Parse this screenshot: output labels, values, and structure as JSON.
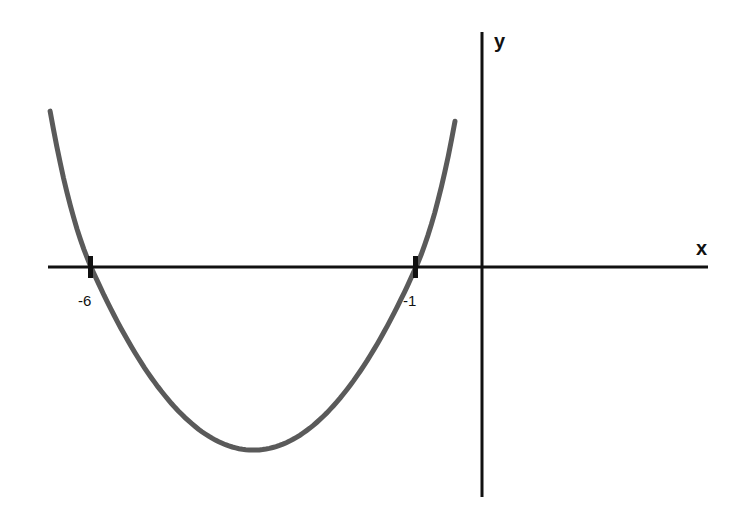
{
  "chart_data": {
    "type": "line",
    "title": "",
    "function": "y = (x + 6)(x + 1)",
    "xlabel": "x",
    "ylabel": "y",
    "x_intercepts": [
      -6,
      -1
    ],
    "tick_labels": [
      "-6",
      "-1"
    ],
    "vertex": {
      "x": -3.5,
      "y": -6.25
    },
    "xlim": [
      -6.65,
      3.5
    ],
    "grid": false,
    "legend": false,
    "series": [
      {
        "name": "parabola",
        "color": "#555555",
        "x": [
          -6.6,
          -6,
          -5,
          -4,
          -3.5,
          -3,
          -2,
          -1,
          -0.4
        ],
        "y": [
          3.96,
          0,
          -4,
          -6,
          -6.25,
          -6,
          -4,
          0,
          3.36
        ]
      }
    ]
  },
  "axes": {
    "x_label": "x",
    "y_label": "y",
    "color": "#111111"
  },
  "ticks": [
    {
      "label": "-6",
      "value": -6
    },
    {
      "label": "-1",
      "value": -1
    }
  ]
}
